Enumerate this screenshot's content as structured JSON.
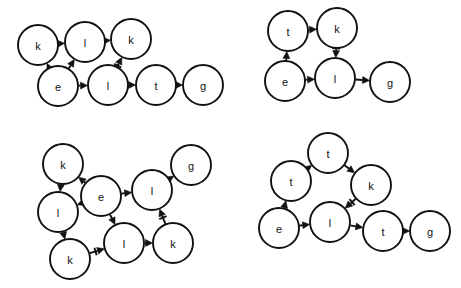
{
  "figure": {
    "background_color": "#ffffff",
    "stroke_color": "#111111",
    "node_fill": "#ffffff",
    "node_radius": 20,
    "width": 461,
    "height": 288
  },
  "graphs": [
    {
      "id": "graph-top-left",
      "name": "top-left-graph",
      "nodes": [
        {
          "id": "k1",
          "label": "k",
          "x": 38,
          "y": 45
        },
        {
          "id": "l1",
          "label": "l",
          "x": 85,
          "y": 42
        },
        {
          "id": "k2",
          "label": "k",
          "x": 131,
          "y": 39
        },
        {
          "id": "e1",
          "label": "e",
          "x": 58,
          "y": 86
        },
        {
          "id": "l2",
          "label": "l",
          "x": 108,
          "y": 85
        },
        {
          "id": "t1",
          "label": "t",
          "x": 156,
          "y": 85
        },
        {
          "id": "g1",
          "label": "g",
          "x": 203,
          "y": 85
        }
      ],
      "edges": [
        {
          "from": "k1",
          "to": "l1",
          "head": "double"
        },
        {
          "from": "l1",
          "to": "k2",
          "head": "single"
        },
        {
          "from": "e1",
          "to": "k1",
          "head": "single"
        },
        {
          "from": "e1",
          "to": "l1",
          "head": "single"
        },
        {
          "from": "l2",
          "to": "k2",
          "head": "double"
        },
        {
          "from": "e1",
          "to": "l2",
          "head": "single"
        },
        {
          "from": "l2",
          "to": "t1",
          "head": "single"
        },
        {
          "from": "t1",
          "to": "g1",
          "head": "single"
        }
      ]
    },
    {
      "id": "graph-top-right",
      "name": "top-right-graph",
      "nodes": [
        {
          "id": "t1",
          "label": "t",
          "x": 288,
          "y": 31
        },
        {
          "id": "k1",
          "label": "k",
          "x": 337,
          "y": 28
        },
        {
          "id": "e1",
          "label": "e",
          "x": 285,
          "y": 81
        },
        {
          "id": "l1",
          "label": "l",
          "x": 335,
          "y": 78
        },
        {
          "id": "g1",
          "label": "g",
          "x": 390,
          "y": 82
        }
      ],
      "edges": [
        {
          "from": "t1",
          "to": "k1",
          "head": "single"
        },
        {
          "from": "k1",
          "to": "l1",
          "head": "double"
        },
        {
          "from": "e1",
          "to": "t1",
          "head": "single"
        },
        {
          "from": "e1",
          "to": "l1",
          "head": "single"
        },
        {
          "from": "l1",
          "to": "g1",
          "head": "single"
        }
      ]
    },
    {
      "id": "graph-bottom-left",
      "name": "bottom-left-graph",
      "nodes": [
        {
          "id": "k1",
          "label": "k",
          "x": 63,
          "y": 164
        },
        {
          "id": "e1",
          "label": "e",
          "x": 101,
          "y": 196
        },
        {
          "id": "l1",
          "label": "l",
          "x": 58,
          "y": 212
        },
        {
          "id": "k2",
          "label": "k",
          "x": 70,
          "y": 259
        },
        {
          "id": "l2",
          "label": "l",
          "x": 124,
          "y": 243
        },
        {
          "id": "k3",
          "label": "k",
          "x": 173,
          "y": 243
        },
        {
          "id": "l3",
          "label": "l",
          "x": 152,
          "y": 190
        },
        {
          "id": "g1",
          "label": "g",
          "x": 191,
          "y": 165
        }
      ],
      "edges": [
        {
          "from": "k1",
          "to": "l1",
          "head": "double"
        },
        {
          "from": "e1",
          "to": "k1",
          "head": "single"
        },
        {
          "from": "e1",
          "to": "l1",
          "head": "single"
        },
        {
          "from": "l1",
          "to": "k2",
          "head": "single"
        },
        {
          "from": "k2",
          "to": "l2",
          "head": "double"
        },
        {
          "from": "e1",
          "to": "l2",
          "head": "single"
        },
        {
          "from": "e1",
          "to": "l3",
          "head": "single"
        },
        {
          "from": "l3",
          "to": "g1",
          "head": "single"
        },
        {
          "from": "l2",
          "to": "k3",
          "head": "single"
        },
        {
          "from": "k3",
          "to": "l3",
          "head": "double"
        }
      ]
    },
    {
      "id": "graph-bottom-right",
      "name": "bottom-right-graph",
      "nodes": [
        {
          "id": "t1",
          "label": "t",
          "x": 328,
          "y": 153
        },
        {
          "id": "t2",
          "label": "t",
          "x": 291,
          "y": 181
        },
        {
          "id": "k1",
          "label": "k",
          "x": 371,
          "y": 185
        },
        {
          "id": "e1",
          "label": "e",
          "x": 279,
          "y": 228
        },
        {
          "id": "l1",
          "label": "l",
          "x": 330,
          "y": 222
        },
        {
          "id": "t3",
          "label": "t",
          "x": 383,
          "y": 231
        },
        {
          "id": "g1",
          "label": "g",
          "x": 430,
          "y": 231
        }
      ],
      "edges": [
        {
          "from": "t2",
          "to": "t1",
          "head": "single"
        },
        {
          "from": "t1",
          "to": "k1",
          "head": "single"
        },
        {
          "from": "k1",
          "to": "l1",
          "head": "double"
        },
        {
          "from": "e1",
          "to": "t2",
          "head": "single"
        },
        {
          "from": "e1",
          "to": "l1",
          "head": "single"
        },
        {
          "from": "l1",
          "to": "t3",
          "head": "single"
        },
        {
          "from": "t3",
          "to": "g1",
          "head": "single"
        }
      ]
    }
  ]
}
